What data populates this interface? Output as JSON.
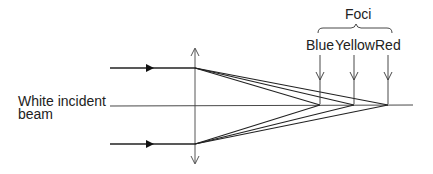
{
  "diagram": {
    "beam_label_line1": "White incident",
    "beam_label_line2": "beam",
    "foci_title": "Foci",
    "foci": [
      {
        "label": "Blue",
        "x": 320
      },
      {
        "label": "Yellow",
        "x": 354
      },
      {
        "label": "Red",
        "x": 388
      }
    ]
  }
}
